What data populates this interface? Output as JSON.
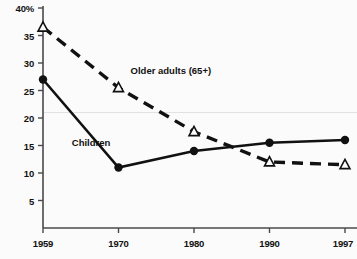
{
  "chart_data": {
    "type": "line",
    "title": "",
    "subtitle": "",
    "xlabel": "",
    "ylabel": "",
    "x": [
      1959,
      1970,
      1980,
      1990,
      1997
    ],
    "xtick_labels": [
      "1959",
      "1970",
      "1980",
      "1990",
      "1997"
    ],
    "ytick_labels": [
      "40%",
      "35",
      "30",
      "25",
      "20",
      "15",
      "10",
      "5"
    ],
    "ytick_values": [
      40,
      35,
      30,
      25,
      20,
      15,
      10,
      5
    ],
    "ylim": [
      0,
      40
    ],
    "xlim": [
      1959,
      1997
    ],
    "grid": "single faint horizontal gridline near 21%",
    "gridline_values": [
      21
    ],
    "legend": "inline data labels",
    "legend_position": "inline",
    "series": [
      {
        "name": "Older adults (65+)",
        "label": "Older adults (65+)",
        "marker": "triangle-open",
        "line_style": "dashed",
        "color": "#111111",
        "values": [
          36.5,
          25.5,
          17.5,
          12.0,
          11.5
        ],
        "label_x": 1971.6,
        "label_y": 28.5
      },
      {
        "name": "Children",
        "label": "Children",
        "marker": "circle-filled",
        "line_style": "solid",
        "color": "#111111",
        "values": [
          27.0,
          11.0,
          14.0,
          15.5,
          16.0
        ],
        "label_x": 1963.2,
        "label_y": 15.5
      }
    ]
  },
  "style": {
    "background": "#fbfbfb",
    "axis_color": "#4a4a4a",
    "ink": "#111111",
    "gridline_color": "#e2e2e2"
  }
}
